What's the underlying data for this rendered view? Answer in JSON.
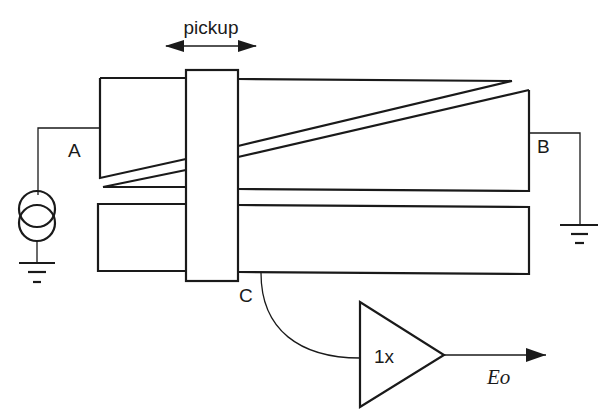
{
  "diagram": {
    "type": "potentiometric-displacement-sensor",
    "labels": {
      "pickup": "pickup",
      "node_a": "A",
      "node_b": "B",
      "node_c": "C",
      "buffer_gain": "1x",
      "output": "Eo"
    },
    "components": [
      {
        "id": "current-source",
        "label": "current source (two overlapping circles)"
      },
      {
        "id": "upper-resistive-element",
        "label": "wedge-shaped split resistive strip between A and B"
      },
      {
        "id": "lower-collector-strip",
        "label": "rectangular collector strip"
      },
      {
        "id": "pickup-slider",
        "label": "movable pickup block with bidirectional arrow"
      },
      {
        "id": "buffer-amplifier",
        "label": "unity gain buffer 1x"
      },
      {
        "id": "ground-a",
        "label": "ground below current source"
      },
      {
        "id": "ground-b",
        "label": "ground at node B"
      }
    ],
    "colors": {
      "line": "#1a1a1a",
      "background": "#ffffff"
    }
  }
}
